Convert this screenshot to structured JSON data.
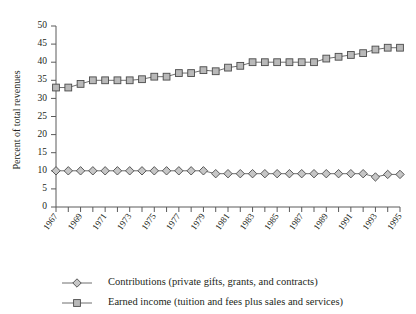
{
  "chart_data": {
    "type": "line",
    "title": "",
    "xlabel": "",
    "ylabel": "Percent of total revenues",
    "ylim": [
      0,
      50
    ],
    "ytick_step": 5,
    "yticks": [
      "0",
      "5",
      "10",
      "15",
      "20",
      "25",
      "30",
      "35",
      "40",
      "45",
      "50"
    ],
    "grid": false,
    "legend_position": "bottom-left",
    "x": [
      1967,
      1968,
      1969,
      1970,
      1971,
      1972,
      1973,
      1974,
      1975,
      1976,
      1977,
      1978,
      1979,
      1980,
      1981,
      1982,
      1983,
      1984,
      1985,
      1986,
      1987,
      1988,
      1989,
      1990,
      1991,
      1992,
      1993,
      1994,
      1995
    ],
    "xtick_labels": [
      "1967",
      "1969",
      "1971",
      "1973",
      "1975",
      "1977",
      "1979",
      "1981",
      "1983",
      "1985",
      "1987",
      "1989",
      "1991",
      "1993",
      "1995"
    ],
    "xtick_values": [
      1967,
      1969,
      1971,
      1973,
      1975,
      1977,
      1979,
      1981,
      1983,
      1985,
      1987,
      1989,
      1991,
      1993,
      1995
    ],
    "series": [
      {
        "name": "Contributions (private gifts, grants, and contracts)",
        "marker": "diamond",
        "color": "#c6c6c6",
        "values": [
          10.0,
          10.0,
          10.0,
          10.0,
          10.0,
          10.0,
          10.0,
          10.0,
          10.0,
          10.0,
          10.0,
          10.0,
          10.0,
          9.2,
          9.2,
          9.2,
          9.2,
          9.2,
          9.2,
          9.2,
          9.2,
          9.2,
          9.2,
          9.2,
          9.2,
          9.2,
          8.3,
          9.0,
          9.0
        ]
      },
      {
        "name": "Earned income (tuition and fees plus sales and services)",
        "marker": "square",
        "color": "#b9b9b9",
        "values": [
          33.0,
          33.0,
          34.0,
          35.0,
          35.0,
          35.0,
          35.0,
          35.3,
          36.0,
          36.0,
          37.0,
          37.0,
          37.8,
          37.5,
          38.5,
          39.0,
          40.0,
          40.0,
          40.0,
          40.0,
          40.0,
          40.0,
          41.0,
          41.5,
          42.0,
          42.5,
          43.5,
          44.0,
          44.0
        ]
      }
    ]
  },
  "legend": {
    "items": [
      {
        "label": "Contributions (private gifts, grants, and contracts)",
        "marker": "diamond"
      },
      {
        "label": "Earned income (tuition and fees plus sales and services)",
        "marker": "square"
      }
    ]
  },
  "axes": {
    "y_title": "Percent of total revenues"
  }
}
